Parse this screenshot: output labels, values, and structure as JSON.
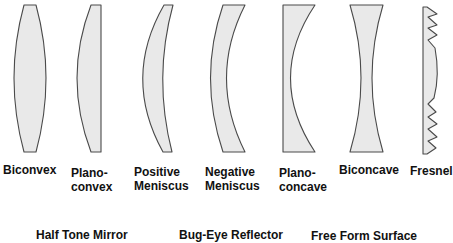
{
  "colors": {
    "lens_fill": "#e9e9e9",
    "lens_stroke": "#4a4a4a",
    "text": "#111111"
  },
  "lenses": [
    {
      "id": "biconvex",
      "label_line1": "Biconvex",
      "label_line2": ""
    },
    {
      "id": "plano-convex",
      "label_line1": "Plano-",
      "label_line2": "convex"
    },
    {
      "id": "positive-meniscus",
      "label_line1": "Positive",
      "label_line2": "Meniscus"
    },
    {
      "id": "negative-meniscus",
      "label_line1": "Negative",
      "label_line2": "Meniscus"
    },
    {
      "id": "plano-concave",
      "label_line1": "Plano-",
      "label_line2": "concave"
    },
    {
      "id": "biconcave",
      "label_line1": "Biconcave",
      "label_line2": ""
    },
    {
      "id": "fresnel",
      "label_line1": "Fresnel",
      "label_line2": ""
    }
  ],
  "bottom_labels": [
    "Half Tone Mirror",
    "Bug-Eye Reflector",
    "Free Form Surface"
  ]
}
